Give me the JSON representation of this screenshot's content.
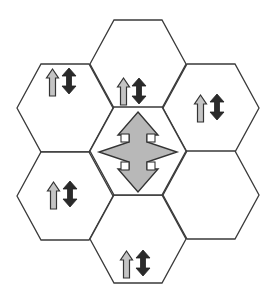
{
  "diagram": {
    "type": "hexagonal-cell-layout",
    "colors": {
      "background": "#ffffff",
      "hex_stroke": "#3a3a3a",
      "light_arrow_fill": "#c4c4c4",
      "dark_arrow_fill": "#2a2a2a",
      "center_arrow_fill": "#b8b8b8",
      "arrow_stroke": "#333333"
    },
    "cells": [
      {
        "id": "top",
        "cx": 138,
        "cy": 64,
        "icons": [
          "up-arrow",
          "up-down-arrow"
        ],
        "icon_x": 117,
        "icon_y": 78
      },
      {
        "id": "upper-left",
        "cx": 65,
        "cy": 108,
        "icons": [
          "up-arrow",
          "up-down-arrow"
        ],
        "icon_x": 47,
        "icon_y": 68
      },
      {
        "id": "upper-right",
        "cx": 211,
        "cy": 108,
        "icons": [
          "up-arrow",
          "up-down-arrow"
        ],
        "icon_x": 194,
        "icon_y": 95
      },
      {
        "id": "center",
        "cx": 138,
        "cy": 151,
        "icons": [
          "four-way-arrow"
        ]
      },
      {
        "id": "lower-left",
        "cx": 65,
        "cy": 196,
        "icons": [
          "up-arrow",
          "up-down-arrow"
        ],
        "icon_x": 48,
        "icon_y": 182
      },
      {
        "id": "lower-right",
        "cx": 211,
        "cy": 195,
        "icons": []
      },
      {
        "id": "bottom",
        "cx": 138,
        "cy": 239,
        "icons": [
          "up-arrow",
          "up-down-arrow"
        ],
        "icon_x": 121,
        "icon_y": 251
      }
    ]
  }
}
